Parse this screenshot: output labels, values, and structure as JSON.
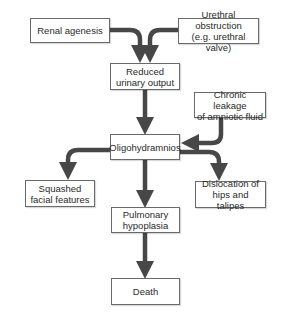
{
  "diagram": {
    "nodes": {
      "renal_agenesis": "Renal agenesis",
      "urethral_obstruction": "Urethral obstruction\n(e.g. urethral valve)",
      "reduced_urinary_output": "Reduced\nurinary output",
      "chronic_leakage": "Chronic leakage\nof amniotic fluid",
      "oligohydramnios": "Oligohydramnios",
      "squashed_facial": "Squashed\nfacial features",
      "dislocation_hips": "Dislocation of\nhips and talipes",
      "pulmonary_hypoplasia": "Pulmonary\nhypoplasia",
      "death": "Death"
    },
    "edges": [
      {
        "from": "Renal agenesis",
        "to": "Reduced urinary output"
      },
      {
        "from": "Urethral obstruction (e.g. urethral valve)",
        "to": "Reduced urinary output"
      },
      {
        "from": "Reduced urinary output",
        "to": "Oligohydramnios"
      },
      {
        "from": "Chronic leakage of amniotic fluid",
        "to": "Oligohydramnios"
      },
      {
        "from": "Oligohydramnios",
        "to": "Squashed facial features"
      },
      {
        "from": "Oligohydramnios",
        "to": "Dislocation of hips and talipes"
      },
      {
        "from": "Oligohydramnios",
        "to": "Pulmonary hypoplasia"
      },
      {
        "from": "Pulmonary hypoplasia",
        "to": "Death"
      }
    ],
    "colors": {
      "arrow": "#474747",
      "box_border": "#6a6a6a",
      "text": "#2a2a2a"
    }
  }
}
